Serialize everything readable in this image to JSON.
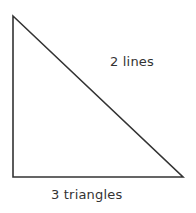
{
  "diagram": {
    "shape": "right-triangle",
    "vertices": [
      [
        13,
        16
      ],
      [
        13,
        177
      ],
      [
        183,
        177
      ]
    ],
    "stroke_color": "#333333",
    "labels": {
      "lines": "2 lines",
      "triangles": "3 triangles"
    }
  }
}
